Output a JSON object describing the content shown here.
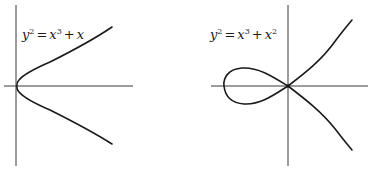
{
  "figures": [
    {
      "id": "left",
      "equation": {
        "lhs_base": "y",
        "lhs_exp": "2",
        "eq": "=",
        "t1_base": "x",
        "t1_exp": "3",
        "plus": "+",
        "t2_base": "x",
        "t2_exp": ""
      },
      "equation_text": "y^2 = x^3 + x",
      "description": "Smooth elliptic curve, single branch opening right, vertex at origin"
    },
    {
      "id": "right",
      "equation": {
        "lhs_base": "y",
        "lhs_exp": "2",
        "eq": "=",
        "t1_base": "x",
        "t1_exp": "3",
        "plus": "+",
        "t2_base": "x",
        "t2_exp": "2"
      },
      "equation_text": "y^2 = x^3 + x^2",
      "description": "Nodal cubic with a loop to the left of the origin and a self-crossing node at the origin"
    }
  ],
  "colors": {
    "curve": "#1a1a1a",
    "axis": "#3a3a3a",
    "background": "#ffffff"
  }
}
